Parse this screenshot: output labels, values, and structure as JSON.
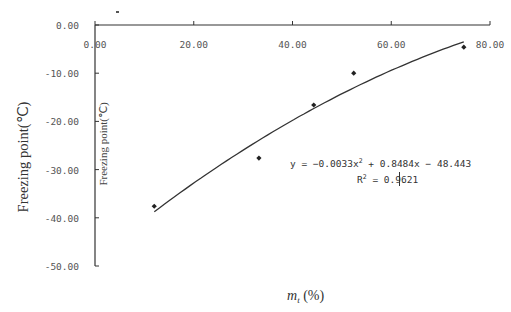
{
  "chart_data": {
    "type": "scatter",
    "title": "",
    "xlabel": "m_t (%)",
    "xlabel_main": "m",
    "xlabel_sub": "t",
    "xlabel_suffix": " (%)",
    "ylabel": "Freezing point(℃)",
    "ylabel_inner": "Freezing point(℃)",
    "xlim": [
      0,
      80
    ],
    "ylim": [
      -50,
      0
    ],
    "x_ticks": [
      "0.00",
      "20.00",
      "40.00",
      "60.00",
      "80.00"
    ],
    "x_tick_values": [
      0,
      20,
      40,
      60,
      80
    ],
    "y_ticks": [
      "0.00",
      "-10.00",
      "-20.00",
      "-30.00",
      "-40.00",
      "-50.00"
    ],
    "y_tick_values": [
      0,
      -10,
      -20,
      -30,
      -40,
      -50
    ],
    "grid": false,
    "legend": "none",
    "series": [
      {
        "name": "measured",
        "type": "scatter",
        "marker": "diamond",
        "x": [
          12.0,
          33.2,
          44.3,
          52.4,
          74.7
        ],
        "y": [
          -37.6,
          -27.6,
          -16.6,
          -10.0,
          -4.6
        ]
      },
      {
        "name": "polynomial trendline",
        "type": "line",
        "coefficients": {
          "a": -0.0033,
          "b": 0.8484,
          "c": -48.443
        },
        "x_range": [
          12.0,
          74.7
        ]
      }
    ],
    "annotations": [
      {
        "text": "y = -0.0033x² + 0.8484x - 48.443"
      },
      {
        "text": "R² = 0.9621"
      }
    ]
  },
  "labels": {
    "equation_prefix": "y = −0.0033x",
    "equation_sup": "2",
    "equation_rest": " + 0.8484x − 48.443",
    "r2_prefix": "R",
    "r2_sup": "2",
    "r2_rest": " = 0.9621"
  }
}
